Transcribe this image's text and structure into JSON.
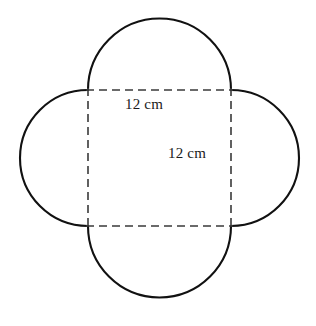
{
  "figure": {
    "name": "four-petal-quatrefoil-on-square",
    "background_color": "#ffffff",
    "outline_color": "#111111",
    "dashed_color": "#3a3a3a",
    "square": {
      "left": 88,
      "top": 90,
      "right": 231,
      "bottom": 226,
      "side_label": "12 cm"
    },
    "labels": {
      "width": "12 cm",
      "height": "12 cm"
    },
    "petals": [
      {
        "name": "top-semicircle",
        "side": "top"
      },
      {
        "name": "right-semicircle",
        "side": "right"
      },
      {
        "name": "bottom-semicircle",
        "side": "bottom"
      },
      {
        "name": "left-semicircle",
        "side": "left"
      }
    ]
  }
}
